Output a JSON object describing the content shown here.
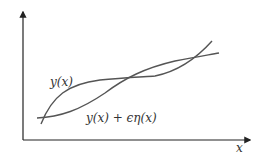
{
  "diagram": {
    "type": "function-variation-sketch",
    "axes": {
      "x_label": "x",
      "y_label": ""
    },
    "curves": [
      {
        "name": "y-curve",
        "label": "y(x)",
        "color": "#555555"
      },
      {
        "name": "perturbed-curve",
        "label": "y(x) + ϵη(x)",
        "color": "#555555"
      }
    ]
  }
}
